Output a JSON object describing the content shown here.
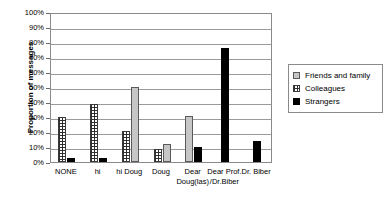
{
  "chart_data": {
    "type": "bar",
    "title": "",
    "xlabel": "",
    "ylabel": "Proportion of messages",
    "ylim": [
      0,
      100
    ],
    "yticks": [
      "0%",
      "10%",
      "20%",
      "30%",
      "40%",
      "50%",
      "60%",
      "70%",
      "80%",
      "90%",
      "100%"
    ],
    "grid": true,
    "legend_position": "right",
    "categories": [
      "NONE",
      "hi",
      "hi Doug",
      "Doug",
      "Dear\nDoug(las)",
      "Dear Prof.\n/Dr.Biber",
      "Dr. Biber"
    ],
    "series": [
      {
        "name": "Friends and family",
        "color": "#c6c6c6",
        "pattern": "solid-light-gray",
        "values": [
          0,
          0,
          50,
          12,
          31,
          0,
          0
        ]
      },
      {
        "name": "Colleagues",
        "color": "#2e2e2e",
        "pattern": "checkered",
        "values": [
          30,
          39,
          21,
          9,
          0,
          0,
          0
        ]
      },
      {
        "name": "Strangers",
        "color": "#000000",
        "pattern": "solid-black",
        "values": [
          3,
          3,
          0,
          0,
          10,
          76,
          14
        ]
      }
    ]
  },
  "legend": {
    "items": [
      {
        "label": "Friends and family",
        "swatch": "ff"
      },
      {
        "label": "Colleagues",
        "swatch": "col"
      },
      {
        "label": "Strangers",
        "swatch": "str"
      }
    ]
  }
}
